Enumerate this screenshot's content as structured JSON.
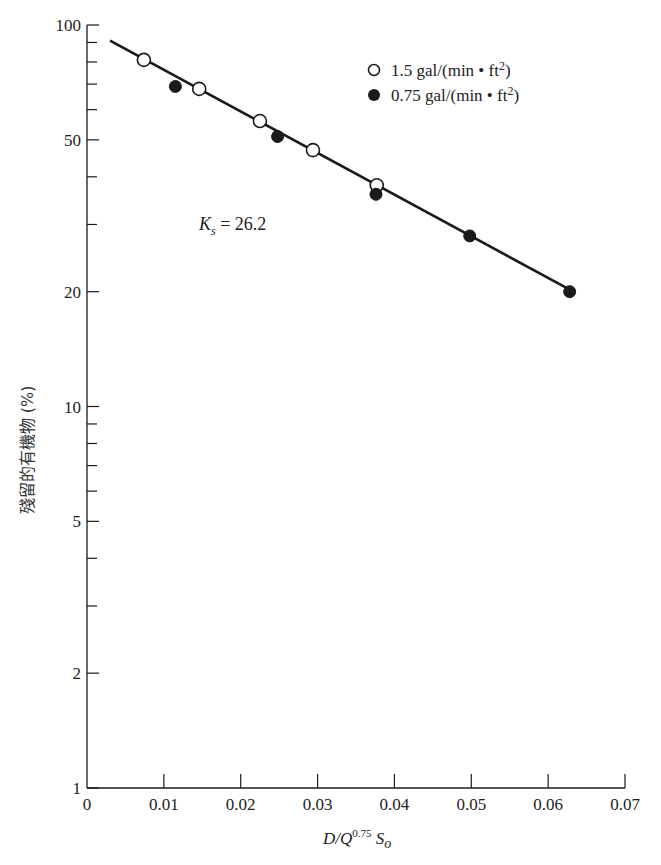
{
  "chart_data": {
    "type": "scatter",
    "title": "",
    "xlabel": "D/Q^0.75 S_o",
    "ylabel": "殘留的有機物 (%)",
    "xlim": [
      0,
      0.07
    ],
    "ylim": [
      1,
      100
    ],
    "yscale": "log",
    "x_ticks": [
      "0",
      "0.01",
      "0.02",
      "0.03",
      "0.04",
      "0.05",
      "0.06",
      "0.07"
    ],
    "y_ticks": [
      "1",
      "2",
      "5",
      "10",
      "20",
      "50",
      "100"
    ],
    "grid": false,
    "legend_position": "upper right",
    "series": [
      {
        "name": "1.5 gal/(min • ft2)",
        "marker": "open-circle",
        "x": [
          0.0074,
          0.0146,
          0.0225,
          0.0294,
          0.0377
        ],
        "y": [
          81,
          68,
          56,
          47,
          38
        ]
      },
      {
        "name": "0.75 gal/(min • ft2)",
        "marker": "filled-circle",
        "x": [
          0.0115,
          0.0248,
          0.0376,
          0.0498,
          0.0628
        ],
        "y": [
          69,
          51,
          36,
          28,
          20
        ]
      }
    ],
    "fit_line": {
      "x": [
        0.003,
        0.0633
      ],
      "y": [
        91,
        20
      ]
    },
    "annotations": [
      "Ks = 26.2"
    ]
  },
  "labels": {
    "ylabel": "殘留的有機物 (%)",
    "xlabel_main": "D/Q",
    "xlabel_exp": "0.75",
    "xlabel_tail": " S",
    "xlabel_sub": "o",
    "annot_k": "K",
    "annot_sub": "s",
    "annot_value": " = 26.2",
    "legend_open": "1.5 gal/(min • ft",
    "legend_filled": "0.75 gal/(min • ft",
    "legend_sup": "2",
    "legend_close": ")"
  },
  "colors": {
    "ink": "#1a1a1a",
    "background": "#ffffff"
  }
}
